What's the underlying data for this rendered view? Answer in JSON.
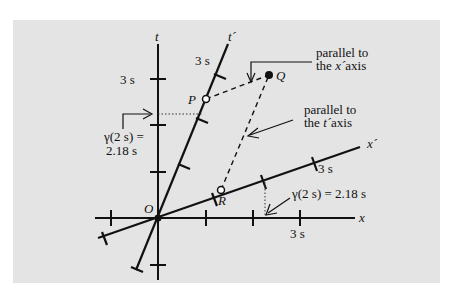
{
  "diagram": {
    "type": "spacetime-diagram",
    "axes": {
      "t": {
        "label": "t",
        "tick_label": "3 s"
      },
      "x": {
        "label": "x",
        "tick_label": "3 s"
      },
      "t_prime": {
        "label": "t´",
        "tick_label": "3 s"
      },
      "x_prime": {
        "label": "x´",
        "tick_label": "3 s"
      }
    },
    "points": {
      "origin": "O",
      "P": "P",
      "Q": "Q",
      "R": "R"
    },
    "annotations": {
      "parallel_x_line1": "parallel to",
      "parallel_x_line2_pre": "the ",
      "parallel_x_line2_axis": "x´",
      "parallel_x_line2_post": "axis",
      "parallel_t_line1": "parallel to",
      "parallel_t_line2_pre": "the ",
      "parallel_t_line2_axis": "t´",
      "parallel_t_line2_post": "axis",
      "gamma_t_line1": "γ(2 s) =",
      "gamma_t_line2": "2.18 s",
      "gamma_x": "γ(2 s) = 2.18 s"
    },
    "colors": {
      "background": "#e4e4e4",
      "ink": "#111111"
    }
  }
}
